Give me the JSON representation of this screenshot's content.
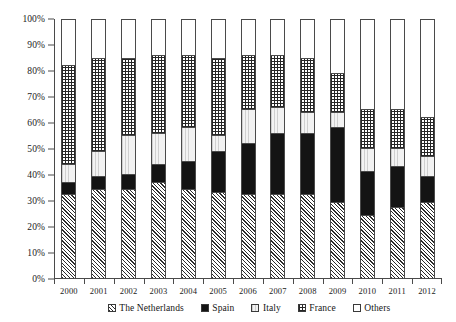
{
  "chart_data": {
    "type": "bar",
    "stacked": true,
    "stack_mode": "percent",
    "title": "",
    "subtitle": "",
    "xlabel": "",
    "ylabel": "",
    "ylim": [
      0,
      100
    ],
    "y_unit": "%",
    "grid": false,
    "legend_position": "bottom",
    "y_ticks": [
      "0%",
      "10%",
      "20%",
      "30%",
      "40%",
      "50%",
      "60%",
      "70%",
      "80%",
      "90%",
      "100%"
    ],
    "y_tick_values": [
      0,
      10,
      20,
      30,
      40,
      50,
      60,
      70,
      80,
      90,
      100
    ],
    "categories": [
      "2000",
      "2001",
      "2002",
      "2003",
      "2004",
      "2005",
      "2006",
      "2007",
      "2008",
      "2009",
      "2010",
      "2011",
      "2012"
    ],
    "series": [
      {
        "name": "The Netherlands",
        "pattern": "diagonal-hatch",
        "color": "#ffffff",
        "values": [
          32,
          34,
          34,
          37,
          34,
          33,
          32,
          32,
          32,
          29,
          24,
          27,
          29
        ]
      },
      {
        "name": "Spain",
        "pattern": "solid",
        "color": "#141414",
        "values": [
          5,
          5,
          6,
          7,
          11,
          16,
          20,
          24,
          24,
          29,
          17,
          16,
          10
        ]
      },
      {
        "name": "Italy",
        "pattern": "light",
        "color": "#f2f2f2",
        "values": [
          7,
          10,
          15,
          12,
          13,
          6,
          13,
          10,
          8,
          6,
          9,
          7,
          8
        ]
      },
      {
        "name": "France",
        "pattern": "grid",
        "color": "#ffffff",
        "values": [
          38,
          36,
          30,
          30,
          28,
          30,
          21,
          20,
          21,
          15,
          15,
          15,
          15
        ]
      },
      {
        "name": "Others",
        "pattern": "empty",
        "color": "#ffffff",
        "values": [
          18,
          15,
          15,
          14,
          14,
          15,
          14,
          14,
          15,
          21,
          35,
          35,
          38
        ]
      }
    ],
    "cumulative_tops": [
      {
        "year": "2000",
        "netherlands": 32,
        "spain": 37,
        "italy": 44,
        "france": 82,
        "others": 100
      },
      {
        "year": "2001",
        "netherlands": 34,
        "spain": 39,
        "italy": 49,
        "france": 85,
        "others": 100
      },
      {
        "year": "2002",
        "netherlands": 34,
        "spain": 40,
        "italy": 55,
        "france": 85,
        "others": 100
      },
      {
        "year": "2003",
        "netherlands": 37,
        "spain": 44,
        "italy": 56,
        "france": 86,
        "others": 100
      },
      {
        "year": "2004",
        "netherlands": 34,
        "spain": 45,
        "italy": 58,
        "france": 86,
        "others": 100
      },
      {
        "year": "2005",
        "netherlands": 33,
        "spain": 49,
        "italy": 55,
        "france": 85,
        "others": 100
      },
      {
        "year": "2006",
        "netherlands": 32,
        "spain": 52,
        "italy": 65,
        "france": 86,
        "others": 100
      },
      {
        "year": "2007",
        "netherlands": 32,
        "spain": 56,
        "italy": 66,
        "france": 86,
        "others": 100
      },
      {
        "year": "2008",
        "netherlands": 32,
        "spain": 56,
        "italy": 64,
        "france": 85,
        "others": 100
      },
      {
        "year": "2009",
        "netherlands": 29,
        "spain": 58,
        "italy": 64,
        "france": 79,
        "others": 100
      },
      {
        "year": "2010",
        "netherlands": 24,
        "spain": 41,
        "italy": 50,
        "france": 65,
        "others": 100
      },
      {
        "year": "2011",
        "netherlands": 27,
        "spain": 43,
        "italy": 50,
        "france": 65,
        "others": 100
      },
      {
        "year": "2012",
        "netherlands": 29,
        "spain": 39,
        "italy": 47,
        "france": 62,
        "others": 100
      }
    ]
  },
  "legend": {
    "items": [
      {
        "label": "The Netherlands",
        "swatch": "netherlands-swatch-icon"
      },
      {
        "label": "Spain",
        "swatch": "spain-swatch-icon"
      },
      {
        "label": "Italy",
        "swatch": "italy-swatch-icon"
      },
      {
        "label": "France",
        "swatch": "france-swatch-icon"
      },
      {
        "label": "Others",
        "swatch": "others-swatch-icon"
      }
    ]
  }
}
